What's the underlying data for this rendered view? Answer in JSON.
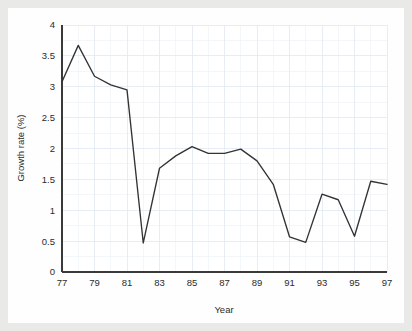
{
  "chart_data": {
    "type": "line",
    "title": "",
    "xlabel": "Year",
    "ylabel": "Growth rate (%)",
    "x": [
      77,
      78,
      79,
      80,
      81,
      82,
      83,
      84,
      85,
      86,
      87,
      88,
      89,
      90,
      91,
      92,
      93,
      94,
      95,
      96,
      97
    ],
    "values": [
      3.08,
      3.67,
      3.17,
      3.03,
      2.95,
      0.47,
      1.68,
      1.88,
      2.03,
      1.92,
      1.92,
      1.99,
      1.8,
      1.42,
      0.57,
      0.48,
      1.26,
      1.17,
      0.58,
      1.47,
      1.42
    ],
    "series": [
      {
        "name": "Growth rate",
        "values": [
          3.08,
          3.67,
          3.17,
          3.03,
          2.95,
          0.47,
          1.68,
          1.88,
          2.03,
          1.92,
          1.92,
          1.99,
          1.8,
          1.42,
          0.57,
          0.48,
          1.26,
          1.17,
          0.58,
          1.47,
          1.42
        ]
      }
    ],
    "xlim": [
      77,
      97
    ],
    "ylim": [
      0,
      4
    ],
    "ytick_labels": [
      "0",
      "0.5",
      "1",
      "1.5",
      "2",
      "2.5",
      "3",
      "3.5",
      "4"
    ],
    "ytick_values": [
      0,
      0.5,
      1,
      1.5,
      2,
      2.5,
      3,
      3.5,
      4
    ],
    "xtick_labels": [
      "77",
      "79",
      "81",
      "83",
      "85",
      "87",
      "89",
      "91",
      "93",
      "95",
      "97"
    ],
    "xtick_values": [
      77,
      79,
      81,
      83,
      85,
      87,
      89,
      91,
      93,
      95,
      97
    ],
    "grid": true,
    "legend": "none",
    "line_color": "#333333",
    "grid_color": "#e3eaf2",
    "background_color": "#e9e9e7",
    "plot_background_color": "#ffffff",
    "axis_color": "#3a3a3a"
  }
}
